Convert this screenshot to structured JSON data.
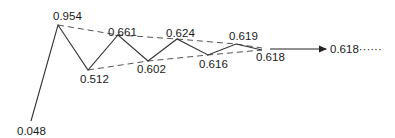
{
  "diagram": {
    "points": [
      {
        "value": "0.048",
        "x": 31,
        "y": 121,
        "lx": 17,
        "ly": 135
      },
      {
        "value": "0.954",
        "x": 58,
        "y": 25,
        "lx": 53,
        "ly": 20
      },
      {
        "value": "0.512",
        "x": 88,
        "y": 70,
        "lx": 80,
        "ly": 84
      },
      {
        "value": "0.661",
        "x": 118,
        "y": 35,
        "lx": 108,
        "ly": 36
      },
      {
        "value": "0.602",
        "x": 148,
        "y": 61,
        "lx": 138,
        "ly": 73
      },
      {
        "value": "0.624",
        "x": 177,
        "y": 39,
        "lx": 167,
        "ly": 37
      },
      {
        "value": "0.616",
        "x": 208,
        "y": 55,
        "lx": 199,
        "ly": 68
      },
      {
        "value": "0.619",
        "x": 236,
        "y": 44,
        "lx": 229,
        "ly": 40
      },
      {
        "value": "0.618",
        "x": 262,
        "y": 50,
        "lx": 256,
        "ly": 61
      }
    ],
    "upper_envelope_label": "maxima (dashed)",
    "lower_envelope_label": "minima (dashed)",
    "limit": {
      "label": "0.618······",
      "value": "0.618",
      "arrow_from_x": 270,
      "arrow_to_x": 326,
      "arrow_y": 49
    },
    "colors": {
      "line": "#333333",
      "dashed": "#555555",
      "text": "#1a1a1a"
    }
  }
}
